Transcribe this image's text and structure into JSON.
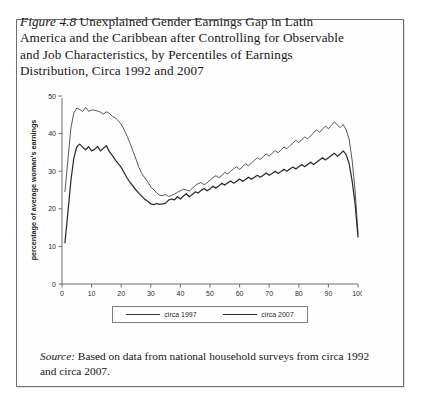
{
  "figure": {
    "label": "Figure 4.8",
    "caption_rest": " Unexplained Gender Earnings Gap in Latin America and the Caribbean after Controlling for Observable and Job Characteristics, by Percentiles of Earnings Distribution, Circa 1992 and 2007",
    "source_label": "Source:",
    "source_rest": " Based on data from national household surveys from circa 1992 and circa 2007."
  },
  "chart_data": {
    "type": "line",
    "title": "",
    "xlabel": "earnings percentile",
    "ylabel": "percentage of average woman's earnings",
    "xlim": [
      0,
      100
    ],
    "ylim": [
      0,
      50
    ],
    "xticks": [
      0,
      10,
      20,
      30,
      40,
      50,
      60,
      70,
      80,
      90,
      100
    ],
    "yticks": [
      0,
      10,
      20,
      30,
      40,
      50
    ],
    "grid": false,
    "legend_position": "bottom-center",
    "colors": {
      "circa_1997": "#3a3a3a",
      "circa_2007": "#2b2b2b",
      "axis": "#4a4a4a",
      "frame": "#6d6d6d"
    },
    "x": [
      1,
      2,
      3,
      4,
      5,
      6,
      7,
      8,
      9,
      10,
      11,
      12,
      13,
      14,
      15,
      16,
      17,
      18,
      19,
      20,
      21,
      22,
      23,
      24,
      25,
      26,
      27,
      28,
      29,
      30,
      31,
      32,
      33,
      34,
      35,
      36,
      37,
      38,
      39,
      40,
      41,
      42,
      43,
      44,
      45,
      46,
      47,
      48,
      49,
      50,
      51,
      52,
      53,
      54,
      55,
      56,
      57,
      58,
      59,
      60,
      61,
      62,
      63,
      64,
      65,
      66,
      67,
      68,
      69,
      70,
      71,
      72,
      73,
      74,
      75,
      76,
      77,
      78,
      79,
      80,
      81,
      82,
      83,
      84,
      85,
      86,
      87,
      88,
      89,
      90,
      91,
      92,
      93,
      94,
      95,
      96,
      97,
      98,
      99,
      100
    ],
    "series": [
      {
        "name": "circa 1997",
        "values": [
          24.6,
          33.0,
          41.5,
          45.5,
          46.8,
          46.4,
          45.9,
          47.0,
          45.9,
          46.3,
          46.2,
          46.0,
          45.7,
          45.2,
          45.8,
          45.4,
          44.6,
          44.2,
          43.4,
          42.5,
          41.0,
          39.3,
          37.4,
          35.3,
          33.2,
          31.0,
          29.3,
          28.2,
          27.1,
          25.8,
          25.1,
          24.2,
          23.6,
          23.5,
          23.8,
          23.3,
          23.5,
          23.9,
          24.4,
          24.8,
          25.2,
          25.0,
          24.7,
          25.4,
          26.2,
          26.7,
          27.0,
          26.4,
          26.9,
          27.6,
          28.3,
          28.8,
          28.3,
          28.9,
          29.6,
          29.3,
          30.0,
          30.7,
          31.2,
          30.5,
          31.2,
          32.0,
          31.4,
          32.2,
          32.9,
          33.6,
          33.1,
          33.9,
          34.6,
          34.0,
          34.8,
          35.5,
          34.9,
          35.7,
          36.4,
          36.0,
          36.8,
          37.5,
          38.2,
          37.6,
          38.4,
          39.1,
          38.6,
          39.4,
          40.2,
          41.0,
          40.3,
          41.2,
          42.0,
          41.3,
          42.2,
          43.1,
          42.3,
          41.6,
          42.4,
          41.0,
          38.5,
          33.0,
          25.0,
          13.5
        ]
      },
      {
        "name": "circa 2007",
        "values": [
          11.0,
          19.0,
          27.5,
          33.5,
          36.5,
          37.2,
          36.4,
          35.7,
          36.5,
          35.4,
          35.8,
          36.6,
          35.4,
          36.1,
          36.8,
          35.2,
          34.2,
          33.0,
          32.0,
          31.0,
          29.6,
          28.2,
          27.0,
          26.0,
          25.0,
          24.1,
          23.3,
          22.5,
          22.0,
          21.3,
          21.1,
          21.4,
          21.2,
          21.3,
          21.5,
          22.3,
          22.6,
          22.4,
          23.2,
          22.6,
          23.4,
          24.0,
          23.2,
          23.8,
          24.5,
          24.2,
          24.9,
          25.4,
          24.8,
          25.3,
          26.0,
          25.5,
          26.1,
          26.8,
          26.3,
          26.9,
          27.4,
          26.8,
          27.3,
          27.9,
          27.3,
          27.8,
          28.4,
          27.9,
          28.4,
          28.9,
          28.4,
          28.9,
          29.5,
          28.9,
          29.4,
          30.0,
          29.4,
          29.9,
          30.5,
          30.0,
          30.6,
          31.1,
          30.6,
          31.2,
          31.8,
          31.2,
          31.8,
          32.4,
          31.8,
          32.4,
          33.0,
          33.6,
          33.0,
          33.6,
          34.2,
          34.8,
          34.0,
          34.6,
          35.4,
          34.4,
          32.0,
          27.5,
          21.5,
          12.5
        ]
      }
    ]
  }
}
